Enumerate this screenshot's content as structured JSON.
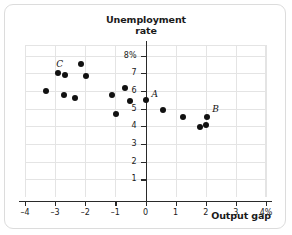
{
  "chart_data": {
    "type": "scatter",
    "title": "Unemployment rate",
    "title_line1": "Unemployment",
    "title_line2": "rate",
    "xlabel": "Output gap",
    "ylabel": "Unemployment rate",
    "xlim": [
      -4,
      4
    ],
    "ylim": [
      0,
      8.6
    ],
    "grid": true,
    "legend": "none",
    "x_ticks": [
      -4,
      -3,
      -2,
      -1,
      0,
      1,
      2,
      3,
      4
    ],
    "x_tick_labels": [
      "–4",
      "–3",
      "–2",
      "–1",
      "0",
      "1",
      "2",
      "3",
      "4%"
    ],
    "y_ticks": [
      1,
      2,
      3,
      4,
      5,
      6,
      7,
      8
    ],
    "y_tick_labels": [
      "1",
      "2",
      "3",
      "4",
      "5",
      "6",
      "7",
      "8%"
    ],
    "points": [
      {
        "x": -3.3,
        "y": 6.0,
        "label": ""
      },
      {
        "x": -2.9,
        "y": 7.0,
        "label": "C"
      },
      {
        "x": -2.72,
        "y": 5.75,
        "label": ""
      },
      {
        "x": -2.67,
        "y": 6.9,
        "label": ""
      },
      {
        "x": -2.35,
        "y": 5.6,
        "label": ""
      },
      {
        "x": -2.13,
        "y": 7.5,
        "label": ""
      },
      {
        "x": -1.97,
        "y": 6.85,
        "label": ""
      },
      {
        "x": -1.1,
        "y": 5.75,
        "label": ""
      },
      {
        "x": -0.98,
        "y": 4.7,
        "label": ""
      },
      {
        "x": -0.67,
        "y": 6.15,
        "label": ""
      },
      {
        "x": -0.52,
        "y": 5.45,
        "label": ""
      },
      {
        "x": 0.0,
        "y": 5.5,
        "label": "A"
      },
      {
        "x": 0.57,
        "y": 4.95,
        "label": ""
      },
      {
        "x": 1.25,
        "y": 4.5,
        "label": ""
      },
      {
        "x": 1.8,
        "y": 3.95,
        "label": ""
      },
      {
        "x": 2.02,
        "y": 4.1,
        "label": ""
      },
      {
        "x": 2.05,
        "y": 4.55,
        "label": "B"
      }
    ],
    "annotations": [
      {
        "text": "A",
        "x": 0.0,
        "y": 5.5
      },
      {
        "text": "B",
        "x": 2.05,
        "y": 4.55
      },
      {
        "text": "C",
        "x": -2.9,
        "y": 7.0
      }
    ],
    "colors": {
      "point": "#111111",
      "grid": "#e4e4e4",
      "axis": "#2a2a2a",
      "text": "#1a1a1a",
      "background": "#ffffff",
      "border": "#dcdcdc"
    }
  }
}
